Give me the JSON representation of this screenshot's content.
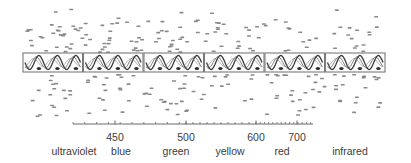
{
  "diagram": {
    "title": "",
    "panels": {
      "count": 6,
      "x_start": 23,
      "width": 60.5,
      "top": 53,
      "height": 19,
      "stroke": "#7a7a7a",
      "wave_color": "#3a3a3a"
    },
    "axis": {
      "x_start": 73,
      "x_end": 313,
      "y": 124,
      "color": "#6a6a6a",
      "ticks": [
        {
          "label": "450",
          "x": 115
        },
        {
          "label": "500",
          "x": 186
        },
        {
          "label": "600",
          "x": 256
        },
        {
          "label": "700",
          "x": 297
        }
      ]
    },
    "bands": [
      {
        "label": "ultraviolet",
        "x": 74
      },
      {
        "label": "blue",
        "x": 121
      },
      {
        "label": "green",
        "x": 176
      },
      {
        "label": "yellow",
        "x": 230
      },
      {
        "label": "red",
        "x": 282
      },
      {
        "label": "infrared",
        "x": 350
      }
    ],
    "particles": {
      "color": "#8a8a8a",
      "description": "scattered short gray dashes above and below the wave panels"
    }
  }
}
